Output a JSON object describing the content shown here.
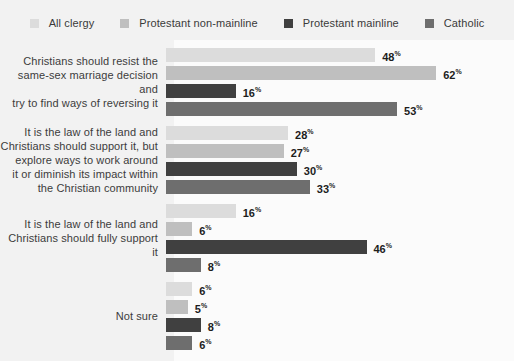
{
  "legend": {
    "items": [
      {
        "label": "All clergy",
        "color": "#dcdcdc",
        "swatch_icon": "legend-swatch-icon"
      },
      {
        "label": "Protestant non-mainline",
        "color": "#bfbfbf",
        "swatch_icon": "legend-swatch-icon"
      },
      {
        "label": "Protestant mainline",
        "color": "#404040",
        "swatch_icon": "legend-swatch-icon"
      },
      {
        "label": "Catholic",
        "color": "#6e6e6e",
        "swatch_icon": "legend-swatch-icon"
      }
    ]
  },
  "chart_data": {
    "type": "bar",
    "title": "",
    "subtitle": "",
    "xlabel": "",
    "ylabel": "",
    "orientation": "horizontal",
    "grid": false,
    "legend_position": "top-center",
    "xlim": [
      0,
      70
    ],
    "value_suffix": "%",
    "categories": [
      "Christians should resist the same-sex marriage decision and try to find ways of reversing it",
      "It is the law of the land and Christians should support it, but explore ways to work around it or diminish its impact within the Christian community",
      "It is the law of the land and Christians should fully support it",
      "Not sure"
    ],
    "category_lines": [
      [
        "Christians should resist the",
        "same-sex marriage decision and",
        "try to find ways of reversing it"
      ],
      [
        "It is the law of the land and",
        "Christians should support it, but",
        "explore ways to work around",
        "it or diminish its impact within",
        "the Christian community"
      ],
      [
        "It is the law of the land and",
        "Christians should fully support it"
      ],
      [
        "Not sure"
      ]
    ],
    "series": [
      {
        "name": "All clergy",
        "color": "#dcdcdc",
        "values": [
          48,
          28,
          16,
          6
        ]
      },
      {
        "name": "Protestant non-mainline",
        "color": "#bfbfbf",
        "values": [
          62,
          27,
          6,
          5
        ]
      },
      {
        "name": "Protestant mainline",
        "color": "#404040",
        "values": [
          16,
          30,
          46,
          8
        ]
      },
      {
        "name": "Catholic",
        "color": "#6e6e6e",
        "values": [
          53,
          33,
          8,
          6
        ]
      }
    ],
    "labels": [
      [
        "48",
        "62",
        "16",
        "53"
      ],
      [
        "28",
        "27",
        "30",
        "33"
      ],
      [
        "16",
        "6",
        "46",
        "8"
      ],
      [
        "6",
        "5",
        "8",
        "6"
      ]
    ]
  },
  "style": {
    "page_background": "#f2f2f2",
    "plot_background": "#fbfbfb",
    "label_text_color": "#3c3c3c",
    "value_text_color": "#1d1d1d"
  }
}
